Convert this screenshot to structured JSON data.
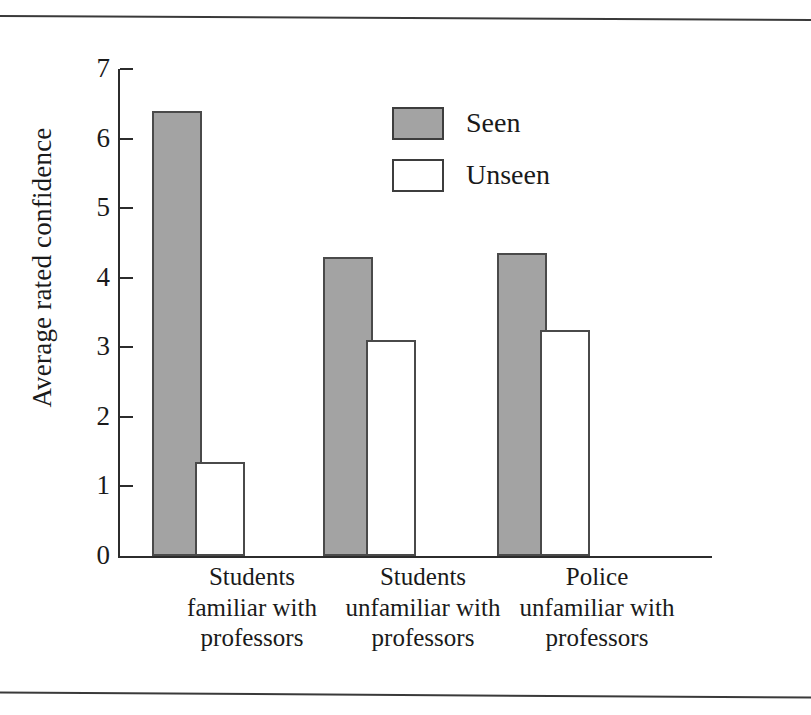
{
  "figure": {
    "has_top_rule": true,
    "has_bottom_rule": true
  },
  "chart_data": {
    "type": "bar",
    "title": "",
    "xlabel": "",
    "ylabel": "Average rated confidence",
    "ylim": [
      0,
      7
    ],
    "yticks": [
      0,
      1,
      2,
      3,
      4,
      5,
      6,
      7
    ],
    "ytick_labels": [
      "0",
      "1",
      "2",
      "3",
      "4",
      "5",
      "6",
      "7"
    ],
    "grid": false,
    "legend_position": "upper center",
    "categories": [
      "Students\nfamiliar with\nprofessors",
      "Students\nunfamiliar with\nprofessors",
      "Police\nunfamiliar with\nprofessors"
    ],
    "series": [
      {
        "name": "Seen",
        "color": "#a3a3a3",
        "edge_color": "#4a4a4a",
        "values": [
          6.4,
          4.3,
          4.35
        ]
      },
      {
        "name": "Unseen",
        "color": "#ffffff",
        "edge_color": "#4a4a4a",
        "values": [
          1.35,
          3.1,
          3.25
        ]
      }
    ]
  },
  "legend": {
    "items": [
      {
        "label": "Seen",
        "swatch": "filled"
      },
      {
        "label": "Unseen",
        "swatch": "empty"
      }
    ]
  },
  "colors": {
    "seen_fill": "#a3a3a3",
    "unseen_fill": "#ffffff",
    "axis": "#2c2c2c",
    "text": "#1a1a1a",
    "rule": "#3a3a3a"
  }
}
